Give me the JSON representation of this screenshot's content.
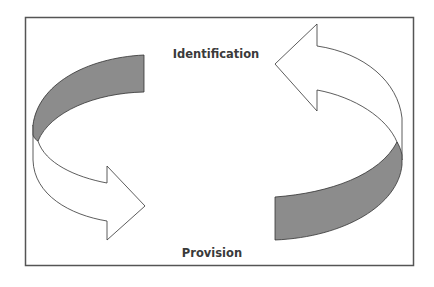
{
  "diagram": {
    "type": "cycle",
    "labels": {
      "top": "Identification",
      "bottom": "Provision"
    },
    "arrows": [
      {
        "name": "left-arrow",
        "direction": "clockwise-down-right",
        "from": "Identification",
        "to": "Provision"
      },
      {
        "name": "right-arrow",
        "direction": "clockwise-up-left",
        "from": "Provision",
        "to": "Identification"
      }
    ],
    "colors": {
      "frame": "#555555",
      "band_fill": "#8c8c8c",
      "arrow_fill": "#ffffff",
      "stroke": "#333333",
      "text": "#3a3a3a"
    }
  }
}
